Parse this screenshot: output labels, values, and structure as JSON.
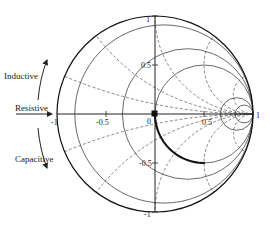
{
  "chart_data": {
    "type": "scatter",
    "chart_kind": "smith-chart",
    "title": "",
    "side_labels": [
      "Inductive",
      "Resistive",
      "Capacitive"
    ],
    "axis_tick_labels": {
      "real": [
        "-1",
        "-0.5",
        "0",
        "0.5",
        "1"
      ],
      "imag": [
        "1",
        "0.5",
        "-0.5",
        "-1"
      ]
    },
    "resistance_circles": [
      0,
      0.1,
      0.5,
      1,
      5,
      10
    ],
    "reactance_arcs": [
      0.2,
      0.5,
      1,
      2,
      5,
      -0.2,
      -0.5,
      -1,
      -2,
      -5
    ],
    "series": [
      {
        "name": "impedance trajectory",
        "marker": "dot",
        "description": "points along r=1 circle from Γ=(0,0) to Γ≈(0.5,-0.5)",
        "gamma_points": [
          [
            0.0,
            0.0
          ],
          [
            0.005,
            -0.07
          ],
          [
            0.02,
            -0.14
          ],
          [
            0.045,
            -0.21
          ],
          [
            0.08,
            -0.27
          ],
          [
            0.12,
            -0.33
          ],
          [
            0.17,
            -0.38
          ],
          [
            0.22,
            -0.42
          ],
          [
            0.28,
            -0.46
          ],
          [
            0.34,
            -0.48
          ],
          [
            0.4,
            -0.495
          ],
          [
            0.46,
            -0.5
          ],
          [
            0.5,
            -0.5
          ]
        ]
      }
    ],
    "xlim": [
      -1,
      1
    ],
    "ylim": [
      -1,
      1
    ],
    "grid": true
  },
  "labels": {
    "inductive": "Inductive",
    "resistive": "Resistive",
    "capacitive": "Capacitive",
    "tick_re_neg1": "-1",
    "tick_re_neg05": "-0.5",
    "tick_re_0": "0",
    "tick_re_05": "0.5",
    "tick_re_1": "1",
    "tick_im_1": "1",
    "tick_im_05": "0.5",
    "tick_im_neg05": "-0.5",
    "tick_im_neg1": "-1"
  }
}
